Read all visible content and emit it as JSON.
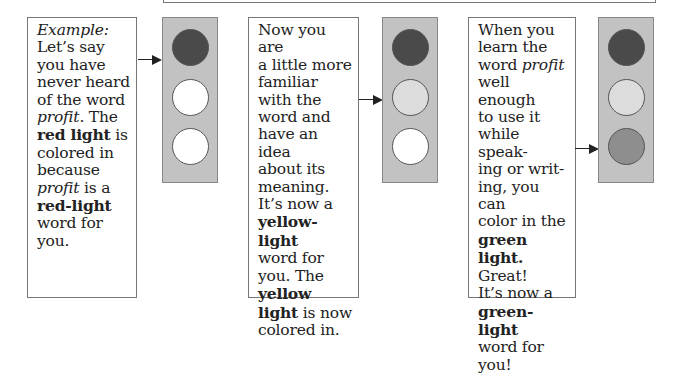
{
  "colors": {
    "light_box_bg": "#c2c2c2",
    "red_on": "#4a4a4a",
    "yellow_on": "#dcdcdc",
    "green_on": "#8e8e8e",
    "off": "#ffffff"
  },
  "panels": [
    {
      "text": {
        "l1": "Example:",
        "l2": "Let’s say",
        "l3": "you have",
        "l4": "never heard",
        "l5a": "of the word",
        "l6a": "profit",
        "l6b": ". The",
        "l7a": "red light",
        "l7b": " is",
        "l8": "colored in",
        "l9": "because",
        "l10a": "profit",
        "l10b": " is a",
        "l11": "red-light",
        "l12": "word for",
        "l13": "you."
      },
      "active_light": "red"
    },
    {
      "text": {
        "l1": "Now you are",
        "l2": "a little more",
        "l3": "familiar",
        "l4": "with the",
        "l5": "word and",
        "l6": "have an idea",
        "l7": "about its",
        "l8": "meaning.",
        "l9": "It’s now a",
        "l10": "yellow-light",
        "l11": "word for",
        "l12": "you. The",
        "l13": "yellow",
        "l14a": "light",
        "l14b": " is now",
        "l15": "colored in."
      },
      "active_light": "yellow"
    },
    {
      "text": {
        "l1": "When you",
        "l2": "learn the",
        "l3a": "word ",
        "l3b": "profit",
        "l4": "well enough",
        "l5": "to use it",
        "l6": "while speak-",
        "l7": "ing or writ-",
        "l8": "ing, you can",
        "l9": "color in the",
        "l10": "green",
        "l11a": "light.",
        "l11b": " Great!",
        "l12": "It’s now a",
        "l13": "green-light",
        "l14": "word for",
        "l15": "you!"
      },
      "active_light": "green"
    }
  ]
}
